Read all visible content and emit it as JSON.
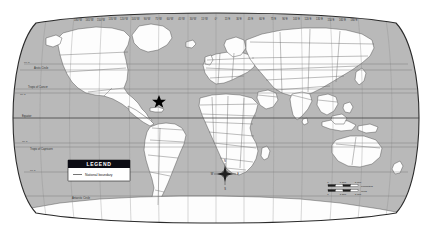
{
  "map": {
    "projection": "Robinson",
    "title": "World Map",
    "ocean_color": "#b9b9b9",
    "land_color": "#fdfdfd",
    "boundary_color": "#5a5a5a",
    "graticule_color": "#8d8d8d",
    "frame_color": "#2b2b2b"
  },
  "longitude_labels": [
    "180°W",
    "165°W",
    "150°W",
    "135°W",
    "120°W",
    "105°W",
    "90°W",
    "75°W",
    "60°W",
    "45°W",
    "30°W",
    "15°W",
    "0°",
    "15°E",
    "30°E",
    "45°E",
    "60°E",
    "75°E",
    "90°E",
    "105°E",
    "120°E",
    "135°E",
    "150°E",
    "165°E",
    "180°E"
  ],
  "latitude_lines": [
    {
      "name": "Arctic Circle",
      "label": "Arctic Circle",
      "degrees": "66°33'N"
    },
    {
      "name": "Tropic of Cancer",
      "label": "Tropic of Cancer",
      "degrees": "23°26'N"
    },
    {
      "name": "Equator",
      "label": "Equator",
      "degrees": "0°"
    },
    {
      "name": "Tropic of Capricorn",
      "label": "Tropic of Capricorn",
      "degrees": "23°26'S"
    },
    {
      "name": "Antarctic Circle",
      "label": "Antarctic Circle",
      "degrees": "66°33'S"
    }
  ],
  "latitude_numbers": [
    "60°N",
    "30°N",
    "30°S",
    "60°S"
  ],
  "legend": {
    "title": "LEGEND",
    "items": [
      {
        "label": "National boundary",
        "symbol": "line",
        "color": "#3a3a3a"
      }
    ]
  },
  "compass": {
    "name": "compass-rose",
    "north": "N",
    "south": "S",
    "east": "E",
    "west": "W"
  },
  "scale_bar": {
    "units": "Kilometers",
    "ticks": [
      "0",
      "1,500",
      "3,000"
    ],
    "second_units": "Miles",
    "second_ticks": [
      "0",
      "1,500",
      "3,000"
    ]
  },
  "marker": {
    "name": "location-star",
    "label": "",
    "color": "#000000",
    "approx_location": "Caribbean"
  }
}
